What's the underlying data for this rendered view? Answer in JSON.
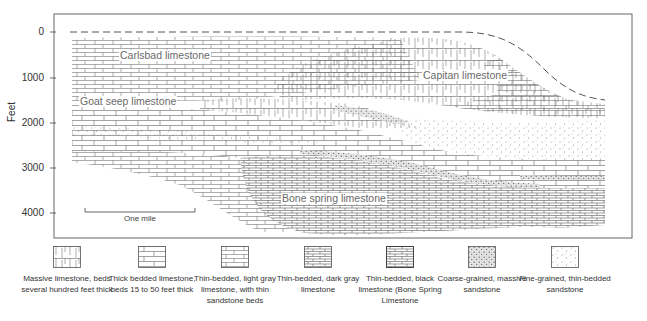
{
  "figure": {
    "type": "geologic cross-section",
    "y_axis": {
      "label": "Feet",
      "ticks": [
        "0",
        "1000",
        "2000",
        "3000",
        "4000"
      ]
    },
    "formations": [
      {
        "id": "carlsbad",
        "label": "Carlsbad limestone"
      },
      {
        "id": "capitan",
        "label": "Capitan limestone"
      },
      {
        "id": "goat_seep",
        "label": "Goat seep limestone"
      },
      {
        "id": "bone_spring",
        "label": "Bone spring limestone"
      }
    ],
    "scale_bar": {
      "label": "One mile"
    }
  },
  "legend": [
    {
      "pattern": "massive-limestone",
      "label": "Massive limestone, beds several hundred feet thick"
    },
    {
      "pattern": "thick-bedded-limestone",
      "label": "Thick bedded limestone, beds 15 to 50 feet thick"
    },
    {
      "pattern": "thin-bedded-light-gray-limestone",
      "label": "Thin-bedded, light gray limestone, with thin sandstone beds"
    },
    {
      "pattern": "thin-bedded-dark-gray-limestone",
      "label": "Thin-bedded, dark gray limestone"
    },
    {
      "pattern": "thin-bedded-black-limestone",
      "label": "Thin-bedded, black limestone (Bone Spring Limestone"
    },
    {
      "pattern": "coarse-grained-sandstone",
      "label": "Coarse-grained, massive sandstone"
    },
    {
      "pattern": "fine-grained-sandstone",
      "label": "Fine-grained, thin-bedded sandstone"
    }
  ],
  "colors": {
    "line": "#555555",
    "label": "#6a6a6a",
    "background": "#ffffff"
  }
}
